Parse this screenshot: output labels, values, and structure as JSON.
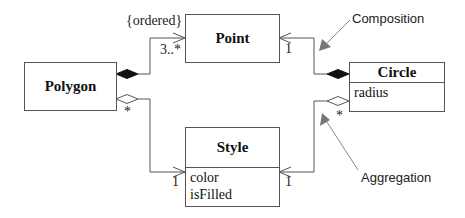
{
  "diagram": {
    "type": "UML class diagram",
    "classes": [
      {
        "name": "Polygon",
        "attributes": []
      },
      {
        "name": "Point",
        "attributes": []
      },
      {
        "name": "Circle",
        "attributes": [
          "radius"
        ]
      },
      {
        "name": "Style",
        "attributes": [
          "color",
          "isFilled"
        ]
      }
    ],
    "associations": [
      {
        "from": "Polygon",
        "to": "Point",
        "kind": "composition",
        "constraint": "{ordered}",
        "target_multiplicity": "3..*"
      },
      {
        "from": "Polygon",
        "to": "Style",
        "kind": "aggregation",
        "source_multiplicity": "*",
        "target_multiplicity": "1"
      },
      {
        "from": "Circle",
        "to": "Point",
        "kind": "composition",
        "target_multiplicity": "1"
      },
      {
        "from": "Circle",
        "to": "Style",
        "kind": "aggregation",
        "source_multiplicity": "*",
        "target_multiplicity": "1"
      }
    ],
    "labels": {
      "ordered": "{ordered}",
      "poly_point_mult": "3..*",
      "poly_style_src": "*",
      "poly_style_tgt": "1",
      "circle_point_tgt": "1",
      "circle_style_src": "*",
      "circle_style_tgt": "1"
    },
    "annotations": {
      "composition": "Composition",
      "aggregation": "Aggregation"
    },
    "colors": {
      "line": "#555555",
      "annotation_arrow": "#888888"
    }
  }
}
